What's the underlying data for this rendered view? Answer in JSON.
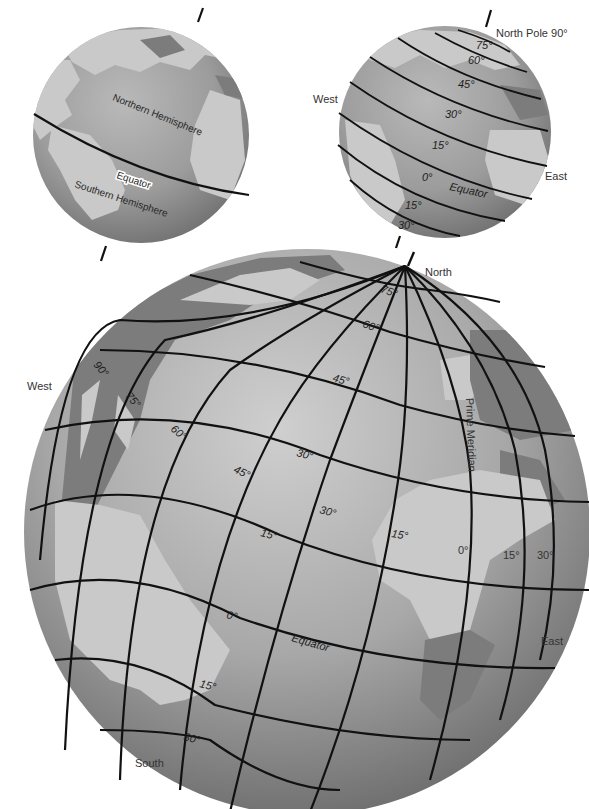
{
  "figure": {
    "colors": {
      "ocean": "#9a9a9a",
      "land_light": "#c9c9c9",
      "land_dark": "#7c7c7c",
      "grid": "#111111",
      "background": "#ffffff"
    }
  },
  "globe_hemispheres": {
    "northern_label": "Northern Hemisphere",
    "equator_label": "Equator",
    "southern_label": "Southern Hemisphere"
  },
  "globe_latitudes": {
    "north_pole_label": "North Pole 90°",
    "west_label": "West",
    "east_label": "East",
    "equator_label": "Equator",
    "latitudes": [
      "75°",
      "60°",
      "45°",
      "30°",
      "15°",
      "0°",
      "15°",
      "30°"
    ]
  },
  "globe_grid": {
    "north_label": "North",
    "south_label": "South",
    "west_label": "West",
    "east_label": "East",
    "equator_label": "Equator",
    "prime_meridian_label": "Prime Meridian",
    "latitude_labels": {
      "lat75": "75°",
      "lat60": "60°",
      "lat45": "45°",
      "lat30": "30°",
      "lat15": "15°",
      "lat0": "0°",
      "lat15s": "15°",
      "lat30s": "30°"
    },
    "longitude_labels": {
      "w90": "90°",
      "w75": "75°",
      "w60": "60°",
      "w45": "45°",
      "w30": "30°",
      "w15": "15°",
      "e0": "0°",
      "e15": "15°",
      "e30": "30°"
    }
  }
}
